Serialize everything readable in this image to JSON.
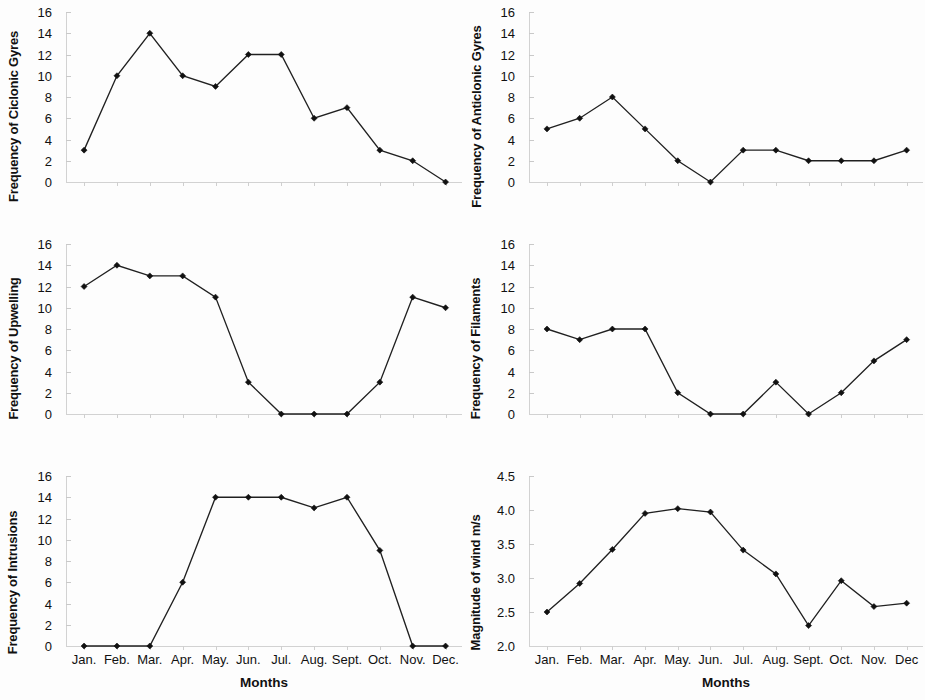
{
  "figure": {
    "width": 925,
    "height": 700,
    "background": "#ffffff",
    "line_color": "#202020",
    "marker_color": "#111111",
    "axis_color": "#d2d2d2"
  },
  "months": [
    "Jan.",
    "Feb.",
    "Mar.",
    "Apr.",
    "May.",
    "Jun.",
    "Jul.",
    "Aug.",
    "Sept.",
    "Oct.",
    "Nov.",
    "Dec."
  ],
  "months_right": [
    "Jan.",
    "Feb.",
    "Mar.",
    "Apr.",
    "May.",
    "Jun.",
    "Jul.",
    "Aug.",
    "Sept.",
    "Oct.",
    "Nov.",
    "Dec"
  ],
  "xlabel": "Months",
  "chart_data": [
    {
      "id": "cyclonic-gyres",
      "type": "line",
      "title": "",
      "ylabel": "Frequency of Ciclonic Gyres",
      "xlabel": "",
      "categories": [
        "Jan.",
        "Feb.",
        "Mar.",
        "Apr.",
        "May.",
        "Jun.",
        "Jul.",
        "Aug.",
        "Sept.",
        "Oct.",
        "Nov.",
        "Dec."
      ],
      "values": [
        3,
        10,
        14,
        10,
        9,
        12,
        12,
        6,
        7,
        3,
        2,
        0
      ],
      "ylim": [
        0,
        16
      ],
      "yticks": [
        0,
        2,
        4,
        6,
        8,
        10,
        12,
        14,
        16
      ],
      "ytick_labels": [
        "0",
        "2",
        "4",
        "6",
        "8",
        "10",
        "12",
        "14",
        "16"
      ],
      "grid": false,
      "legend": "none"
    },
    {
      "id": "anticlonic-gyres",
      "type": "line",
      "title": "",
      "ylabel": "Frequency of Anticlonic Gyres",
      "xlabel": "",
      "categories": [
        "Jan.",
        "Feb.",
        "Mar.",
        "Apr.",
        "May.",
        "Jun.",
        "Jul.",
        "Aug.",
        "Sept.",
        "Oct.",
        "Nov.",
        "Dec"
      ],
      "values": [
        5,
        6,
        8,
        5,
        2,
        0,
        3,
        3,
        2,
        2,
        2,
        3
      ],
      "ylim": [
        0,
        16
      ],
      "yticks": [
        0,
        2,
        4,
        6,
        8,
        10,
        12,
        14,
        16
      ],
      "ytick_labels": [
        "0",
        "2",
        "4",
        "6",
        "8",
        "10",
        "12",
        "14",
        "16"
      ],
      "grid": false,
      "legend": "none"
    },
    {
      "id": "upwelling",
      "type": "line",
      "title": "",
      "ylabel": "Frequency of Upwelling",
      "xlabel": "",
      "categories": [
        "Jan.",
        "Feb.",
        "Mar.",
        "Apr.",
        "May.",
        "Jun.",
        "Jul.",
        "Aug.",
        "Sept.",
        "Oct.",
        "Nov.",
        "Dec."
      ],
      "values": [
        12,
        14,
        13,
        13,
        11,
        3,
        0,
        0,
        0,
        3,
        11,
        10
      ],
      "ylim": [
        0,
        16
      ],
      "yticks": [
        0,
        2,
        4,
        6,
        8,
        10,
        12,
        14,
        16
      ],
      "ytick_labels": [
        "0",
        "2",
        "4",
        "6",
        "8",
        "10",
        "12",
        "14",
        "16"
      ],
      "grid": false,
      "legend": "none"
    },
    {
      "id": "filaments",
      "type": "line",
      "title": "",
      "ylabel": "Frequency of Filaments",
      "xlabel": "",
      "categories": [
        "Jan.",
        "Feb.",
        "Mar.",
        "Apr.",
        "May.",
        "Jun.",
        "Jul.",
        "Aug.",
        "Sept.",
        "Oct.",
        "Nov.",
        "Dec"
      ],
      "values": [
        8,
        7,
        8,
        8,
        2,
        0,
        0,
        3,
        0,
        2,
        5,
        7
      ],
      "ylim": [
        0,
        16
      ],
      "yticks": [
        0,
        2,
        4,
        6,
        8,
        10,
        12,
        14,
        16
      ],
      "ytick_labels": [
        "0",
        "2",
        "4",
        "6",
        "8",
        "10",
        "12",
        "14",
        "16"
      ],
      "grid": false,
      "legend": "none"
    },
    {
      "id": "intrusions",
      "type": "line",
      "title": "",
      "ylabel": "Frequency of Intrusions",
      "xlabel": "Months",
      "categories": [
        "Jan.",
        "Feb.",
        "Mar.",
        "Apr.",
        "May.",
        "Jun.",
        "Jul.",
        "Aug.",
        "Sept.",
        "Oct.",
        "Nov.",
        "Dec."
      ],
      "values": [
        0,
        0,
        0,
        6,
        14,
        14,
        14,
        13,
        14,
        9,
        0,
        0
      ],
      "ylim": [
        0,
        16
      ],
      "yticks": [
        0,
        2,
        4,
        6,
        8,
        10,
        12,
        14,
        16
      ],
      "ytick_labels": [
        "0",
        "2",
        "4",
        "6",
        "8",
        "10",
        "12",
        "14",
        "16"
      ],
      "grid": false,
      "legend": "none"
    },
    {
      "id": "wind-magnitude",
      "type": "line",
      "title": "",
      "ylabel": "Magnitude of wind m/s",
      "xlabel": "Months",
      "categories": [
        "Jan.",
        "Feb.",
        "Mar.",
        "Apr.",
        "May.",
        "Jun.",
        "Jul.",
        "Aug.",
        "Sept.",
        "Oct.",
        "Nov.",
        "Dec"
      ],
      "values": [
        2.5,
        2.92,
        3.42,
        3.95,
        4.02,
        3.97,
        3.41,
        3.06,
        2.3,
        2.96,
        2.58,
        2.63
      ],
      "ylim": [
        2.0,
        4.5
      ],
      "yticks": [
        2.0,
        2.5,
        3.0,
        3.5,
        4.0,
        4.5
      ],
      "ytick_labels": [
        "2.0",
        "2.5",
        "3.0",
        "3.5",
        "4.0",
        "4.5"
      ],
      "grid": false,
      "legend": "none"
    }
  ]
}
